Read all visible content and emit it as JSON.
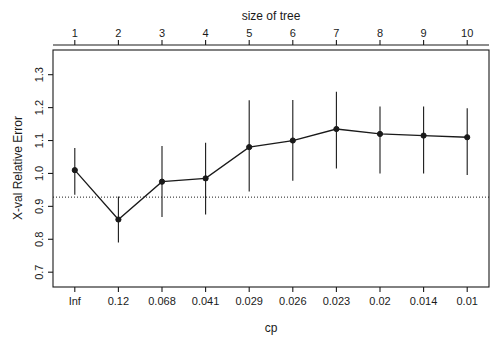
{
  "chart_data": {
    "type": "line",
    "title": "",
    "top_axis_label": "size of tree",
    "xlabel": "cp",
    "ylabel": "X-val Relative Error",
    "categories": [
      "Inf",
      "0.12",
      "0.068",
      "0.041",
      "0.029",
      "0.026",
      "0.023",
      "0.02",
      "0.014",
      "0.01"
    ],
    "tree_sizes": [
      "1",
      "2",
      "3",
      "4",
      "5",
      "6",
      "7",
      "8",
      "9",
      "10"
    ],
    "values": [
      1.01,
      0.86,
      0.975,
      0.985,
      1.08,
      1.1,
      1.135,
      1.12,
      1.115,
      1.11
    ],
    "error_lower": [
      0.935,
      0.79,
      0.868,
      0.875,
      0.945,
      0.978,
      1.015,
      1.0,
      1.0,
      0.995
    ],
    "error_upper": [
      1.077,
      0.93,
      1.083,
      1.093,
      1.222,
      1.223,
      1.248,
      1.203,
      1.203,
      1.198
    ],
    "hline": 0.928,
    "ylim": [
      0.655,
      1.375
    ],
    "yticks": [
      "0.7",
      "0.8",
      "0.9",
      "1.0",
      "1.1",
      "1.2",
      "1.3"
    ],
    "ytickvals": [
      0.7,
      0.8,
      0.9,
      1.0,
      1.1,
      1.2,
      1.3
    ],
    "grid": false,
    "legend": "none",
    "marker": "filled-circle",
    "line_color": "#1a1a1a",
    "hline_style": "dotted"
  },
  "figure": {
    "background": "#ffffff",
    "axis_color": "#1a1a1a"
  }
}
